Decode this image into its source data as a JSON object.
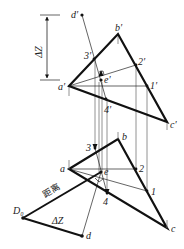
{
  "diagram": {
    "title": "",
    "labels": {
      "d_prime": "d′",
      "b_prime": "b′",
      "a_prime": "a′",
      "c_prime": "c′",
      "e_prime": "e′",
      "p1_prime": "1′",
      "p2_prime": "2′",
      "p3_prime": "3′",
      "p4_prime": "4′",
      "delta_z_top": "ΔZ",
      "a": "a",
      "b": "b",
      "c": "c",
      "d": "d",
      "e": "e",
      "p1": "1",
      "p2": "2",
      "p3": "3",
      "p4": "4",
      "D0": "D₀",
      "delta_z_bottom": "ΔZ",
      "distance": "距离"
    },
    "points": {
      "front_view": {
        "d_prime": [
          82,
          15
        ],
        "b_prime": [
          118,
          34
        ],
        "a_prime": [
          69,
          86
        ],
        "c_prime": [
          167,
          122
        ],
        "e_prime": [
          101,
          80
        ],
        "p1_prime": [
          147,
          86
        ],
        "p2_prime": [
          136,
          65
        ],
        "p3_prime": [
          94,
          59
        ],
        "p4_prime": [
          106,
          99
        ]
      },
      "top_view": {
        "a": [
          69,
          169
        ],
        "b": [
          118,
          139
        ],
        "c": [
          167,
          228
        ],
        "d": [
          82,
          236
        ],
        "e": [
          101,
          172
        ],
        "p1": [
          147,
          191
        ],
        "p2": [
          136,
          169
        ],
        "p3": [
          95,
          148
        ],
        "p4": [
          107,
          193
        ],
        "D0": [
          23,
          218
        ]
      }
    }
  }
}
